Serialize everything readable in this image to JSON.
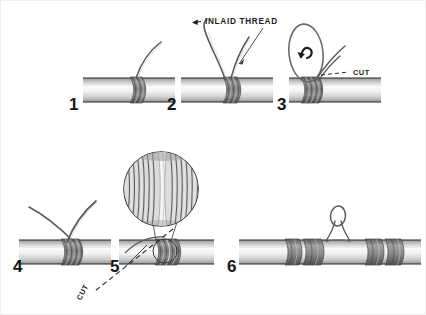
{
  "figure": {
    "background_color": "#ffffff",
    "line_color": "#4a4a4a",
    "thread_color": "#6b6b6b",
    "shade_color": "#8f8f8f"
  },
  "steps": [
    {
      "number": "1",
      "x": 68,
      "y": 95
    },
    {
      "number": "2",
      "x": 166,
      "y": 95
    },
    {
      "number": "3",
      "x": 276,
      "y": 95
    },
    {
      "number": "4",
      "x": 12,
      "y": 257
    },
    {
      "number": "5",
      "x": 109,
      "y": 257
    },
    {
      "number": "6",
      "x": 226,
      "y": 257
    }
  ],
  "annotations": {
    "inlaid_thread": {
      "text": "INLAID  THREAD",
      "x": 204,
      "y": 17
    },
    "cut_step3": {
      "text": "CUT",
      "x": 352,
      "y": 72
    },
    "cut_step5": {
      "text": "CUT",
      "x": 81,
      "y": 300
    }
  }
}
